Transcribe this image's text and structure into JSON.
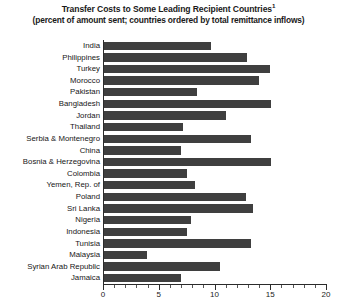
{
  "chart_data": {
    "type": "bar",
    "orientation": "horizontal",
    "title": "Transfer Costs to Some Leading Recipient Countries",
    "title_superscript": "1",
    "subtitle": "(percent of amount sent; countries ordered by total remittance inflows)",
    "xlabel": "",
    "ylabel": "",
    "xlim": [
      0,
      20
    ],
    "xticks": [
      0,
      5,
      10,
      15,
      20
    ],
    "xtick_labels": [
      "0",
      "5",
      "10",
      "15",
      "20"
    ],
    "minor_tick_step": 1,
    "grid": false,
    "legend": null,
    "bar_color": "#3f3f3f",
    "background_color": "#ffffff",
    "categories": [
      "India",
      "Philippines",
      "Turkey",
      "Morocco",
      "Pakistan",
      "Bangladesh",
      "Jordan",
      "Thailand",
      "Serbia & Montenegro",
      "China",
      "Bosnia & Herzegovina",
      "Colombia",
      "Yemen, Rep. of",
      "Poland",
      "Sri Lanka",
      "Nigeria",
      "Indonesia",
      "Tunisia",
      "Malaysia",
      "Syrian Arab Republic",
      "Jamaica"
    ],
    "values": [
      9.6,
      12.8,
      14.9,
      13.9,
      8.3,
      15.0,
      10.9,
      7.1,
      13.2,
      6.9,
      15.0,
      7.4,
      8.2,
      12.7,
      13.4,
      7.8,
      7.4,
      13.2,
      3.9,
      10.4,
      6.9
    ]
  }
}
